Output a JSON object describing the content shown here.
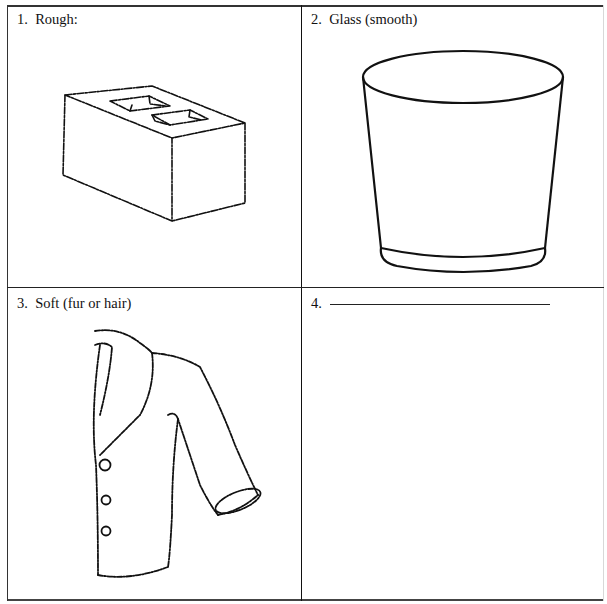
{
  "worksheet": {
    "cells": [
      {
        "number": "1.",
        "label": "Rough:",
        "illustration": "cinder-block"
      },
      {
        "number": "2.",
        "label": "Glass (smooth)",
        "illustration": "drinking-glass"
      },
      {
        "number": "3.",
        "label": "Soft (fur or hair)",
        "illustration": "fur-jacket"
      },
      {
        "number": "4.",
        "label": "",
        "illustration": "none",
        "blank_line": true
      }
    ]
  }
}
